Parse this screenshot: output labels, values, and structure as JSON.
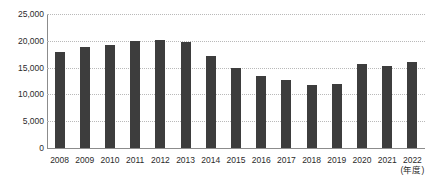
{
  "chart_data": {
    "type": "bar",
    "title": "",
    "xlabel": "(年度)",
    "ylabel": "",
    "ylim": [
      0,
      25000
    ],
    "ytick_values": [
      25000,
      20000,
      15000,
      10000,
      5000,
      0
    ],
    "ytick_labels": [
      "25,000",
      "20,000",
      "15,000",
      "10,000",
      "5,000",
      "0"
    ],
    "grid": true,
    "legend": null,
    "bar_color": "#3d3d3d",
    "categories": [
      "2008",
      "2009",
      "2010",
      "2011",
      "2012",
      "2013",
      "2014",
      "2015",
      "2016",
      "2017",
      "2018",
      "2019",
      "2020",
      "2021",
      "2022"
    ],
    "values": [
      17900,
      18800,
      19200,
      19900,
      20100,
      19700,
      17100,
      15000,
      13500,
      12600,
      11800,
      12000,
      15700,
      15300,
      16000
    ]
  },
  "axis": {
    "x_unit_label": "(年度)"
  }
}
